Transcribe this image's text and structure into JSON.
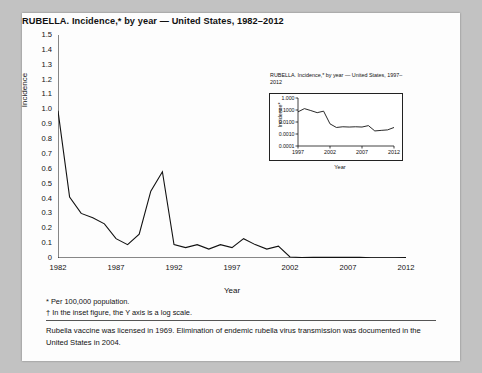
{
  "figure": {
    "title": "RUBELLA. Incidence,* by year — United States, 1982–2012",
    "footnote_1": "* Per 100,000 population.",
    "footnote_2": "† In the inset figure, the Y axis is a log scale.",
    "note": "Rubella vaccine was licensed in 1969. Elimination of endemic rubella virus transmission was documented in the United States in 2004."
  },
  "inset": {
    "title": "RUBELLA. Incidence,* by year — United States, 1997–2012"
  },
  "chart_data": [
    {
      "type": "line",
      "id": "main",
      "title": "RUBELLA. Incidence,* by year — United States, 1982–2012",
      "xlabel": "Year",
      "ylabel": "Incidence",
      "xlim": [
        1982,
        2012
      ],
      "ylim": [
        0,
        1.5
      ],
      "grid": false,
      "xticks": [
        1982,
        1987,
        1992,
        1997,
        2002,
        2007,
        2012
      ],
      "yticks": [
        "0",
        "0.1",
        "0.2",
        "0.3",
        "0.4",
        "0.5",
        "0.6",
        "0.7",
        "0.8",
        "0.9",
        "1.0",
        "1.1",
        "1.2",
        "1.3",
        "1.4",
        "1.5"
      ],
      "x": [
        1982,
        1983,
        1984,
        1985,
        1986,
        1987,
        1988,
        1989,
        1990,
        1991,
        1992,
        1993,
        1994,
        1995,
        1996,
        1997,
        1998,
        1999,
        2000,
        2001,
        2002,
        2003,
        2004,
        2005,
        2006,
        2007,
        2008,
        2009,
        2010,
        2011,
        2012
      ],
      "y": [
        0.99,
        0.41,
        0.3,
        0.27,
        0.23,
        0.13,
        0.09,
        0.16,
        0.45,
        0.58,
        0.09,
        0.07,
        0.09,
        0.06,
        0.09,
        0.07,
        0.13,
        0.09,
        0.06,
        0.08,
        0.007,
        0.003,
        0.004,
        0.004,
        0.004,
        0.004,
        0.005,
        0.002,
        0.002,
        0.002,
        0.003
      ]
    },
    {
      "type": "line",
      "id": "inset",
      "title": "RUBELLA. Incidence,* by year — United States, 1997–2012",
      "xlabel": "Year",
      "ylabel": "Incidence*",
      "log_y": true,
      "ylim": [
        0.0001,
        1.0
      ],
      "xlim": [
        1997,
        2012
      ],
      "xticks": [
        1997,
        2002,
        2007,
        2012
      ],
      "yticks": [
        "0.0001",
        "0.0010",
        "0.0100",
        "0.1000",
        "1.000"
      ],
      "x": [
        1997,
        1998,
        1999,
        2000,
        2001,
        2002,
        2003,
        2004,
        2005,
        2006,
        2007,
        2008,
        2009,
        2010,
        2011,
        2012
      ],
      "y": [
        0.07,
        0.13,
        0.09,
        0.06,
        0.08,
        0.007,
        0.0035,
        0.004,
        0.0038,
        0.004,
        0.0038,
        0.005,
        0.0018,
        0.002,
        0.0022,
        0.0035
      ]
    }
  ]
}
